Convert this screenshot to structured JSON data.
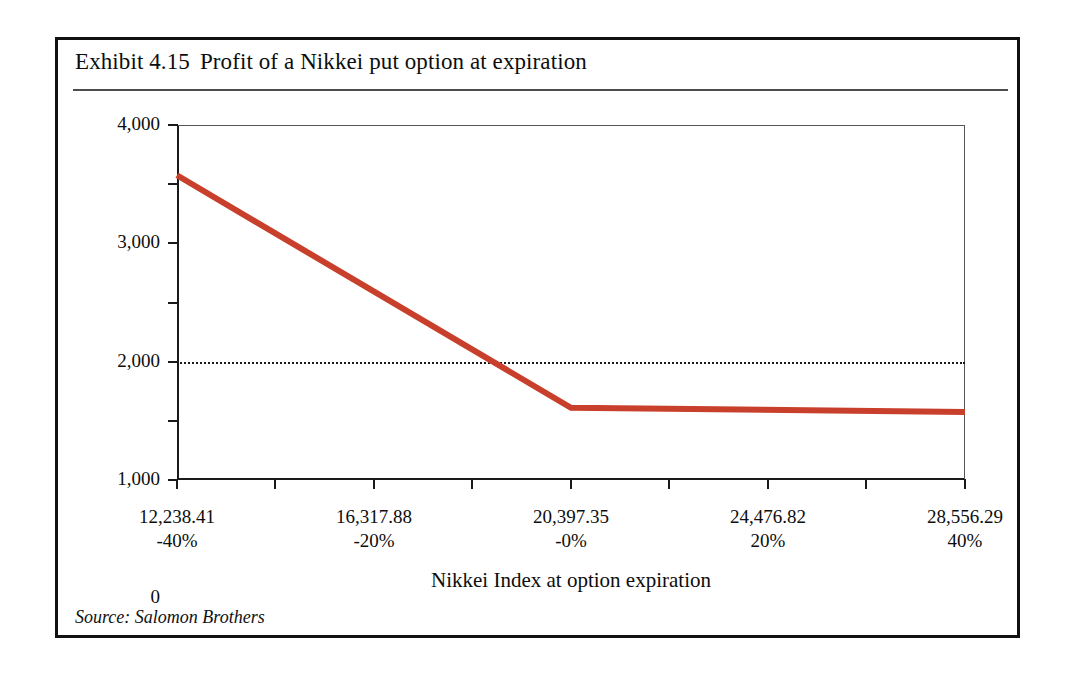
{
  "exhibit": {
    "title_number": "Exhibit 4.15",
    "title_text": "Profit of a Nikkei put option at expiration",
    "source": "Source: Salomon Brothers"
  },
  "chart_data": {
    "type": "line",
    "xlabel": "Nikkei Index at option expiration",
    "ylabel": "Net profit (mn yen)",
    "xlim": [
      12238.41,
      28556.29
    ],
    "ylim": [
      -2000,
      4000
    ],
    "grid": false,
    "legend": "none",
    "zero_reference_line": 0,
    "line_color": "#c8402c",
    "x_tick_values": [
      12238.41,
      16317.88,
      20397.35,
      24476.82,
      28556.29
    ],
    "x_tick_labels": [
      "12,238.41",
      "16,317.88",
      "20,397.35",
      "24,476.82",
      "28,556.29"
    ],
    "x_tick_sublabels": [
      "-40%",
      "-20%",
      "-0%",
      "20%",
      "40%"
    ],
    "x_minor_tick_values": [
      14278.14,
      18357.61,
      22437.08,
      26516.55
    ],
    "x_minor_tick_pcts": [
      "-30%",
      "-10%",
      "10%",
      "30%"
    ],
    "y_tick_values": [
      4000,
      3000,
      2000,
      1000,
      0,
      -1000,
      -2000
    ],
    "y_tick_labels": [
      "4,000",
      "3,000",
      "2,000",
      "1,000",
      "0",
      "-1,000",
      "-2,000"
    ],
    "series": [
      {
        "name": "Net profit of Nikkei put option",
        "x": [
          12238.41,
          20397.35,
          28556.29
        ],
        "y": [
          3150,
          -780,
          -850
        ]
      }
    ],
    "annotations": [
      {
        "text": "strike / break-even region at 20,397.35 (-0%)",
        "x": 20397.35,
        "y": -780
      }
    ]
  }
}
